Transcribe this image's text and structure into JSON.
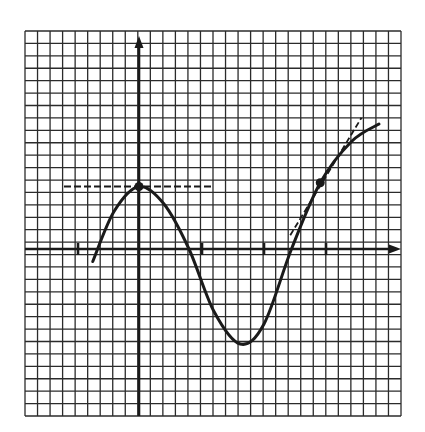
{
  "figure": {
    "grid": {
      "left": 25,
      "top": 31,
      "right": 401,
      "bottom": 416,
      "cell": 12.5,
      "columns": 30,
      "rows": 31
    },
    "axes": {
      "origin_px": [
        139,
        249
      ],
      "x_axis": {
        "from_px": 25,
        "to_px": 401,
        "arrow": "right"
      },
      "y_axis": {
        "from_px": 416,
        "to_px": 36,
        "arrow": "up"
      },
      "x_ticks_px": [
        78,
        202,
        264,
        326
      ]
    },
    "colors": {
      "ink": "#1a1a1a",
      "grid": "#2b2b2b",
      "background": "#ffffff"
    }
  },
  "chart_data": {
    "type": "line",
    "title": "",
    "xlabel": "",
    "ylabel": "",
    "grid": true,
    "units": "grid cells (1 cell = 12.5px), origin at axis intersection",
    "x_ticks": [
      -5,
      5,
      10,
      15
    ],
    "series": [
      {
        "name": "f(x)",
        "points": [
          [
            -3.7,
            -1.0
          ],
          [
            -2.0,
            3.0
          ],
          [
            0.0,
            5.0
          ],
          [
            2.0,
            3.6
          ],
          [
            4.0,
            0.0
          ],
          [
            6.0,
            -5.0
          ],
          [
            8.1,
            -7.6
          ],
          [
            10.0,
            -6.0
          ],
          [
            12.2,
            0.0
          ],
          [
            14.5,
            5.3
          ],
          [
            17.0,
            8.6
          ],
          [
            19.2,
            10.0
          ]
        ]
      }
    ],
    "marked_points": [
      {
        "label": "local max",
        "x": 0.0,
        "y": 5.0
      },
      {
        "label": "tangent point",
        "x": 14.5,
        "y": 5.3
      }
    ],
    "tangent_lines": [
      {
        "style": "dashed",
        "from": [
          -6.0,
          5.0
        ],
        "to": [
          5.9,
          5.0
        ],
        "slope": 0
      },
      {
        "style": "dashed",
        "from": [
          12.1,
          1.1
        ],
        "to": [
          17.8,
          10.5
        ],
        "slope": 1.6
      }
    ]
  }
}
